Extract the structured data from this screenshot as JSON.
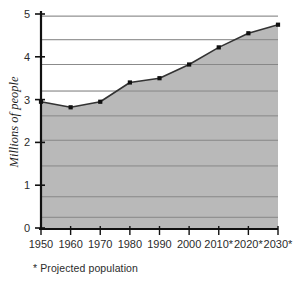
{
  "chart_data": {
    "type": "area",
    "title": "",
    "xlabel": "",
    "ylabel": "Millions of people",
    "categories": [
      "1950",
      "1960",
      "1970",
      "1980",
      "1990",
      "2000",
      "2010*",
      "2020*",
      "2030*"
    ],
    "x_values": [
      1950,
      1960,
      1970,
      1980,
      1990,
      2000,
      2010,
      2020,
      2030
    ],
    "values": [
      2.95,
      2.82,
      2.95,
      3.4,
      3.5,
      3.82,
      4.22,
      4.55,
      4.75
    ],
    "series": [
      {
        "name": "Population",
        "values": [
          2.95,
          2.82,
          2.95,
          3.4,
          3.5,
          3.82,
          4.22,
          4.55,
          4.75
        ]
      }
    ],
    "ylim": [
      0,
      5
    ],
    "y_ticks": [
      0,
      1,
      2,
      3,
      4,
      5
    ],
    "y_tick_labels": [
      "0",
      "1",
      "2",
      "3",
      "4",
      "5"
    ],
    "grid": true,
    "grid_values": [
      0.25,
      0.73,
      1.45,
      2.05,
      2.62,
      3.2,
      3.82,
      4.4,
      4.95
    ],
    "legend": "none",
    "footnote": "*  Projected population",
    "colors": {
      "area_fill": "#b9b9b9",
      "line": "#333333",
      "marker": "#111111",
      "axis": "#1a1a1a",
      "grid": "#8a8a8a",
      "background": "#ffffff"
    }
  }
}
